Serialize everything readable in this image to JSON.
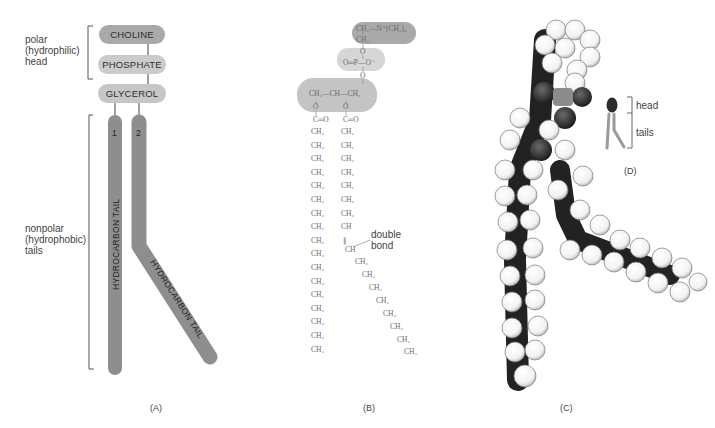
{
  "panel_a": {
    "head_label": [
      "polar",
      "(hydrophilic)",
      "head"
    ],
    "tail_label": [
      "nonpolar",
      "(hydrophobic)",
      "tails"
    ],
    "groups": [
      "CHOLINE",
      "PHOSPHATE",
      "GLYCEROL"
    ],
    "tail_numbers": [
      "1",
      "2"
    ],
    "tail_text": "HYDROCARBON TAIL",
    "caption": "(A)",
    "colors": {
      "choline": "#a9a9a9",
      "phosphate": "#cbcbcb",
      "glycerol": "#c6c6c6",
      "tail": "#8e8e8e"
    }
  },
  "panel_b": {
    "choline_line": "CH₂—N⁺(CH₃)₃",
    "ch2": "CH₂",
    "o": "O",
    "phosphate_line": "O═P—O⁻",
    "glycerol_line": "CH₂—CH—CH₂",
    "carbonyl": "C═O",
    "ch": "CH",
    "ch3": "CH₃",
    "double_bond_label": [
      "double",
      "bond"
    ],
    "caption": "(B)"
  },
  "panel_c": {
    "caption": "(C)"
  },
  "panel_d": {
    "head_label": "head",
    "tails_label": "tails",
    "caption": "(D)"
  }
}
